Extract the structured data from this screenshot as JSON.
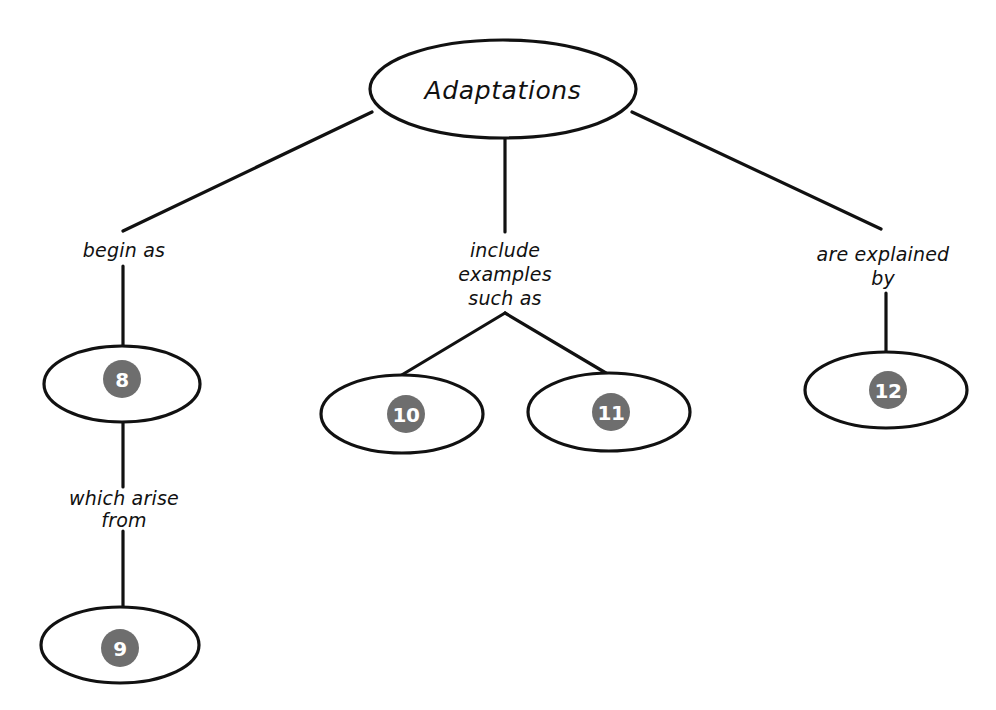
{
  "diagram": {
    "title": "Adaptations",
    "background_color": "#ffffff",
    "ink_color": "#111111",
    "badge_color": "#6e6e6e",
    "badge_text_color": "#ffffff",
    "root": {
      "label": "Adaptations"
    },
    "edge_labels": {
      "left": "begin as",
      "center_line1": "include",
      "center_line2": "examples",
      "center_line3": "such as",
      "right_line1": "are explained",
      "right_line2": "by",
      "left_lower_line1": "which arise",
      "left_lower_line2": "from"
    },
    "blanks": [
      {
        "id": "blank-8",
        "number": "8"
      },
      {
        "id": "blank-9",
        "number": "9"
      },
      {
        "id": "blank-10",
        "number": "10"
      },
      {
        "id": "blank-11",
        "number": "11"
      },
      {
        "id": "blank-12",
        "number": "12"
      }
    ]
  }
}
